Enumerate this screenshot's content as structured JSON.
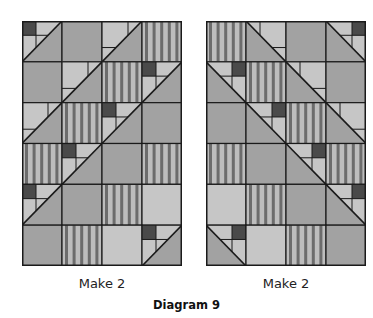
{
  "title": "Diagram 9",
  "colors": {
    "dark": "#4a4a4a",
    "medium": "#a2a2a2",
    "light": "#c6c6c6",
    "stripe_bg": "#bdbdbd",
    "stripe_fg": "#6c6c6c",
    "line": "#1a1a1a"
  },
  "legend": {
    "A": "half-square triangle with dark corner square and light pieces",
    "B": "half-square triangle with light pieces",
    "M": "medium gray solid square",
    "L": "light gray solid square",
    "S": "vertical striped square"
  },
  "quilts": [
    {
      "caption": "Make 2",
      "diagonal": "/",
      "rows": [
        [
          "A",
          "M",
          "B",
          "S"
        ],
        [
          "M",
          "B",
          "S",
          "A"
        ],
        [
          "B",
          "S",
          "A",
          "M"
        ],
        [
          "S",
          "A",
          "M",
          "S"
        ],
        [
          "A",
          "M",
          "S",
          "L"
        ],
        [
          "M",
          "S",
          "L",
          "A"
        ]
      ]
    },
    {
      "caption": "Make 2",
      "diagonal": "\\",
      "rows": [
        [
          "S",
          "B",
          "M",
          "A"
        ],
        [
          "A",
          "S",
          "B",
          "M"
        ],
        [
          "M",
          "A",
          "S",
          "B"
        ],
        [
          "S",
          "M",
          "A",
          "S"
        ],
        [
          "L",
          "S",
          "M",
          "A"
        ],
        [
          "A",
          "L",
          "S",
          "M"
        ]
      ]
    }
  ]
}
